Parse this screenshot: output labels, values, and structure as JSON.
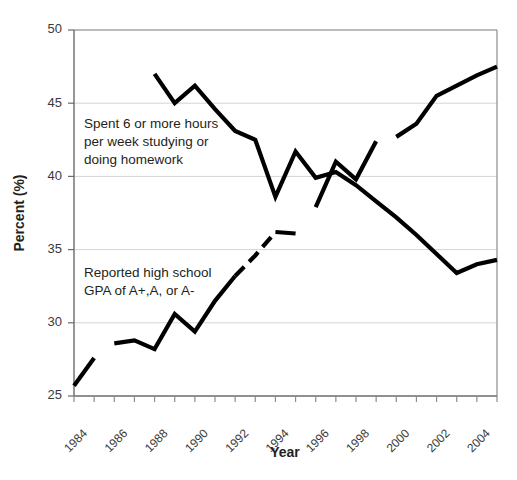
{
  "chart_data": {
    "type": "line",
    "title": "",
    "xlabel": "Year",
    "ylabel": "Percent (%)",
    "xlim": [
      1984,
      2005
    ],
    "ylim": [
      25,
      50
    ],
    "yticks": [
      25,
      30,
      35,
      40,
      45,
      50
    ],
    "ytick_labels": [
      "25",
      "30",
      "35",
      "40",
      "45",
      "50"
    ],
    "xticks": [
      1984,
      1985,
      1986,
      1987,
      1988,
      1989,
      1990,
      1991,
      1992,
      1993,
      1994,
      1995,
      1996,
      1997,
      1998,
      1999,
      2000,
      2001,
      2002,
      2003,
      2004,
      2005
    ],
    "xtick_labels": [
      "1984",
      "1986",
      "1988",
      "1990",
      "1992",
      "1994",
      "1996",
      "1998",
      "2000",
      "2002",
      "2004"
    ],
    "xtick_label_years": [
      1984,
      1986,
      1988,
      1990,
      1992,
      1994,
      1996,
      1998,
      2000,
      2002,
      2004
    ],
    "grid": "horizontal",
    "legend": "inline-annotations",
    "line_color": "#000000",
    "grid_color": "#d4d4d4",
    "axis_color": "#8c8c8c",
    "series": [
      {
        "name": "Spent 6 or more hours per week studying or doing homework",
        "style": "solid",
        "segments": [
          {
            "x": [
              1988,
              1989,
              1990,
              1991,
              1992,
              1993,
              1994,
              1995,
              1996,
              1997,
              1998,
              1999,
              2000,
              2001,
              2002,
              2003,
              2004,
              2005
            ],
            "y": [
              47.0,
              45.0,
              46.2,
              44.6,
              43.1,
              42.5,
              38.6,
              41.7,
              39.9,
              40.3,
              39.4,
              38.3,
              37.2,
              36.0,
              34.7,
              33.4,
              34.0,
              34.3
            ]
          }
        ]
      },
      {
        "name": "Reported high school GPA of A+,A, or A-",
        "style": "solid-with-dashed-gap",
        "segments": [
          {
            "x": [
              1984,
              1985
            ],
            "y": [
              25.7,
              27.6
            ],
            "dashed": false
          },
          {
            "x": [
              1986,
              1987,
              1988,
              1989,
              1990,
              1991,
              1992
            ],
            "y": [
              28.6,
              28.8,
              28.2,
              30.6,
              29.4,
              31.5,
              33.2
            ],
            "dashed": false
          },
          {
            "x": [
              1992,
              1993,
              1994
            ],
            "y": [
              33.2,
              34.6,
              36.2
            ],
            "dashed": true
          },
          {
            "x": [
              1994,
              1995
            ],
            "y": [
              36.2,
              36.1
            ],
            "dashed": false
          },
          {
            "x": [
              1996,
              1997,
              1998,
              1999
            ],
            "y": [
              37.9,
              41.0,
              39.8,
              42.4
            ],
            "dashed": false
          },
          {
            "x": [
              2000,
              2001,
              2002,
              2003,
              2004,
              2005
            ],
            "y": [
              42.7,
              43.6,
              45.5,
              46.2,
              46.9,
              47.5
            ],
            "dashed": false
          }
        ]
      }
    ],
    "annotations": [
      {
        "id": "study-annotation",
        "lines": [
          "Spent 6 or more hours",
          "per week studying or",
          "doing homework"
        ],
        "x_px": 84,
        "y_px": 120
      },
      {
        "id": "gpa-annotation",
        "lines": [
          "Reported high school",
          "GPA of A+,A, or A-"
        ],
        "x_px": 84,
        "y_px": 270
      }
    ]
  },
  "caption": {
    "fragment": ""
  }
}
